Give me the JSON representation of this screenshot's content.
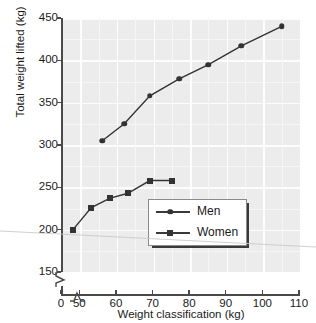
{
  "chart_data": {
    "type": "line",
    "title": "",
    "xlabel": "Weight classification (kg)",
    "ylabel": "Total weight lifted (kg)",
    "xlim": [
      45,
      110
    ],
    "ylim": [
      150,
      450
    ],
    "xticks": [
      0,
      50,
      60,
      70,
      80,
      90,
      100,
      110
    ],
    "yticks": [
      0,
      150,
      200,
      250,
      300,
      350,
      400,
      450
    ],
    "grid": true,
    "axis_break_x": true,
    "axis_break_y": true,
    "legend_position": "lower-right-inside",
    "series": [
      {
        "name": "Men",
        "marker": "circle",
        "x": [
          56,
          62,
          69,
          77,
          85,
          94,
          105
        ],
        "values": [
          305,
          325,
          358,
          378,
          395,
          417,
          440
        ]
      },
      {
        "name": "Women",
        "marker": "square",
        "x": [
          48,
          53,
          58,
          63,
          69,
          75
        ],
        "values": [
          200,
          226,
          237,
          243,
          258,
          258
        ]
      }
    ]
  },
  "axis": {
    "x_tick_labels": [
      "0",
      "50",
      "60",
      "70",
      "80",
      "90",
      "100",
      "110"
    ],
    "y_tick_labels": [
      "0",
      "150",
      "200",
      "250",
      "300",
      "350",
      "400",
      "450"
    ],
    "x_title": "Weight classification (kg)",
    "y_title": "Total weight lifted (kg)"
  },
  "legend": {
    "items": [
      {
        "label": "Men",
        "marker": "circle-marker"
      },
      {
        "label": "Women",
        "marker": "square-marker"
      }
    ]
  },
  "colors": {
    "plot_background": "#ececec",
    "gridline": "#fdfdfd",
    "axis": "#4a4a4a",
    "series": "#333333",
    "legend_shadow": "#3a3a3a"
  }
}
